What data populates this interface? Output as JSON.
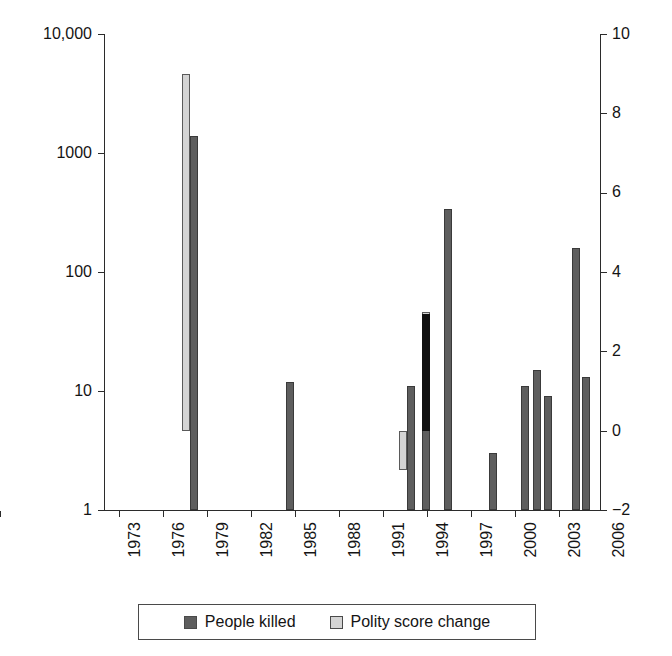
{
  "chart_data": {
    "type": "bar",
    "title": "",
    "subtitle": "",
    "xlabel": "",
    "ylabel_left": "",
    "ylabel_right": "",
    "grid": false,
    "legend_position": "bottom",
    "x_axis": {
      "type": "linear",
      "range": [
        1972,
        2008.5
      ],
      "tick_labels": [
        "1973",
        "1976",
        "1979",
        "1982",
        "1985",
        "1988",
        "1991",
        "1994",
        "1997",
        "2000",
        "2003",
        "2006"
      ],
      "tick_values": [
        1973,
        1976,
        1979,
        1982,
        1985,
        1988,
        1991,
        1994,
        1997,
        2000,
        2003,
        2006
      ],
      "tick_rotation": -90
    },
    "y_axis_left": {
      "type": "log",
      "range": [
        1,
        10000
      ],
      "tick_labels": [
        "10,000",
        "1000",
        "100",
        "10",
        "1"
      ],
      "tick_values": [
        10000,
        1000,
        100,
        10,
        1
      ]
    },
    "y_axis_right": {
      "type": "linear",
      "range": [
        -2,
        10
      ],
      "tick_labels": [
        "10",
        "8",
        "6",
        "4",
        "2",
        "0",
        "-2"
      ],
      "tick_values": [
        10,
        8,
        6,
        4,
        2,
        0,
        -2
      ]
    },
    "series": [
      {
        "name": "People killed",
        "axis": "left",
        "color": "#5e5e5e",
        "points": [
          {
            "x": 1978.6,
            "value": 1400
          },
          {
            "x": 1985.7,
            "value": 12
          },
          {
            "x": 1994.6,
            "value": 11
          },
          {
            "x": 1995.7,
            "value": 44
          },
          {
            "x": 1997.3,
            "value": 340
          },
          {
            "x": 2000.6,
            "value": 3
          },
          {
            "x": 2003.0,
            "value": 11
          },
          {
            "x": 2003.9,
            "value": 15
          },
          {
            "x": 2004.7,
            "value": 9
          },
          {
            "x": 2006.7,
            "value": 160
          },
          {
            "x": 2007.5,
            "value": 13
          }
        ]
      },
      {
        "name": "Polity score change",
        "axis": "right",
        "color": "#d4d4d4",
        "points": [
          {
            "x": 1978.0,
            "from": 0,
            "to": 9
          },
          {
            "x": 1994.0,
            "from": -1,
            "to": 0
          },
          {
            "x": 1995.7,
            "from": 0,
            "to": 3
          }
        ]
      }
    ]
  },
  "legend": {
    "entries": [
      {
        "label": "People killed",
        "swatch": "dark-gray-swatch"
      },
      {
        "label": "Polity score change",
        "swatch": "light-gray-swatch"
      }
    ]
  },
  "axis_labels": {
    "left": [
      "10,000",
      "1000",
      "100",
      "10",
      "1"
    ],
    "right": [
      "10",
      "8",
      "6",
      "4",
      "2",
      "0",
      "−2"
    ],
    "bottom": [
      "1973",
      "1976",
      "1979",
      "1982",
      "1985",
      "1988",
      "1991",
      "1994",
      "1997",
      "2000",
      "2003",
      "2006"
    ]
  }
}
